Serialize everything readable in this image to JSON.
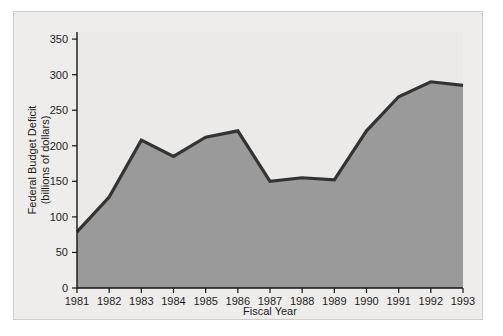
{
  "figure": {
    "background_color": "#efedeb",
    "plot_background_color": "#eceae8",
    "border_color": "#cfcdcb"
  },
  "chart_data": {
    "type": "area",
    "title": "",
    "subtitle": "",
    "xlabel": "Fiscal Year",
    "ylabel": "Federal Budget Deficit (billions of dollars)",
    "ylabel_line1": "Federal Budget Deficit",
    "ylabel_line2": "(billions of dollars)",
    "categories": [
      "1981",
      "1982",
      "1983",
      "1984",
      "1985",
      "1986",
      "1987",
      "1988",
      "1989",
      "1990",
      "1991",
      "1992",
      "1993"
    ],
    "x": [
      1981,
      1982,
      1983,
      1984,
      1985,
      1986,
      1987,
      1988,
      1989,
      1990,
      1991,
      1992,
      1993
    ],
    "values": [
      79,
      128,
      208,
      185,
      212,
      221,
      150,
      155,
      152,
      221,
      269,
      290,
      285
    ],
    "series": [
      {
        "name": "Federal Budget Deficit",
        "values": [
          79,
          128,
          208,
          185,
          212,
          221,
          150,
          155,
          152,
          221,
          269,
          290,
          285
        ]
      }
    ],
    "ylim": [
      0,
      360
    ],
    "xlim": [
      1981,
      1993
    ],
    "yticks": [
      0,
      50,
      100,
      150,
      200,
      250,
      300,
      350
    ],
    "ytick_labels": [
      "0",
      "50",
      "100",
      "150",
      "200",
      "250",
      "300",
      "350"
    ],
    "xtick_labels": [
      "1981",
      "1982",
      "1983",
      "1984",
      "1985",
      "1986",
      "1987",
      "1988",
      "1989",
      "1990",
      "1991",
      "1992",
      "1993"
    ],
    "grid": false,
    "legend": false,
    "legend_position": "none",
    "fill_color": "#9a9a9a",
    "line_color": "#333333",
    "axis_color": "#141414",
    "text_color": "#1c1c1c"
  }
}
